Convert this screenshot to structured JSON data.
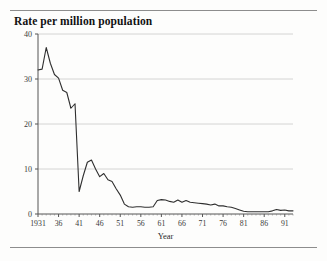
{
  "figure": {
    "title": "Rate per million population"
  },
  "chart_data": {
    "type": "line",
    "title": "Rate per million population",
    "xlabel": "Year",
    "ylabel": "",
    "xlim": [
      1931,
      1993
    ],
    "ylim": [
      0,
      40
    ],
    "grid": "horizontal",
    "legend": "none",
    "yticks": [
      0,
      10,
      20,
      30,
      40
    ],
    "ytick_labels": [
      "0",
      "10",
      "20",
      "30",
      "40"
    ],
    "xticks": [
      1931,
      1936,
      1941,
      1946,
      1951,
      1956,
      1961,
      1966,
      1971,
      1976,
      1981,
      1986,
      1991
    ],
    "xtick_labels": [
      "1931",
      "36",
      "41",
      "46",
      "51",
      "56",
      "61",
      "66",
      "71",
      "76",
      "81",
      "86",
      "91"
    ],
    "series": [
      {
        "name": "Rate per million population",
        "color": "#2f2f2f",
        "x": [
          1931,
          1932,
          1933,
          1934,
          1935,
          1936,
          1937,
          1938,
          1939,
          1940,
          1941,
          1942,
          1943,
          1944,
          1945,
          1946,
          1947,
          1948,
          1949,
          1950,
          1951,
          1952,
          1953,
          1954,
          1955,
          1956,
          1957,
          1958,
          1959,
          1960,
          1961,
          1962,
          1963,
          1964,
          1965,
          1966,
          1967,
          1968,
          1969,
          1970,
          1971,
          1972,
          1973,
          1974,
          1975,
          1976,
          1977,
          1978,
          1979,
          1980,
          1981,
          1982,
          1983,
          1984,
          1985,
          1986,
          1987,
          1988,
          1989,
          1990,
          1991,
          1992,
          1993
        ],
        "values": [
          32.0,
          32.2,
          37.0,
          33.5,
          31.0,
          30.2,
          27.5,
          27.0,
          23.5,
          24.5,
          5.0,
          8.5,
          11.5,
          12.0,
          10.0,
          8.3,
          9.0,
          7.6,
          7.2,
          5.6,
          4.2,
          2.2,
          1.6,
          1.5,
          1.6,
          1.6,
          1.5,
          1.5,
          1.6,
          3.0,
          3.2,
          3.1,
          2.8,
          2.6,
          3.1,
          2.6,
          3.0,
          2.6,
          2.5,
          2.4,
          2.3,
          2.2,
          2.0,
          2.2,
          1.8,
          1.8,
          1.6,
          1.5,
          1.2,
          0.9,
          0.6,
          0.5,
          0.5,
          0.5,
          0.5,
          0.5,
          0.5,
          0.7,
          1.0,
          0.8,
          0.9,
          0.7,
          0.7
        ]
      }
    ]
  },
  "axes": {
    "x_axis_title": "Year"
  }
}
